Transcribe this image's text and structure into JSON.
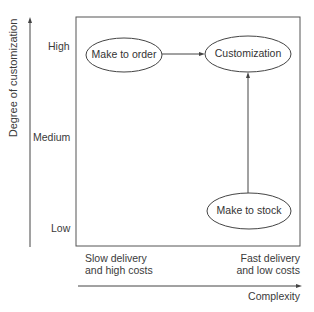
{
  "diagram": {
    "y_axis": {
      "title": "Degree of customization",
      "ticks": [
        "High",
        "Medium",
        "Low"
      ]
    },
    "x_axis": {
      "title": "Complexity",
      "left_label": [
        "Slow delivery",
        "and high costs"
      ],
      "right_label": [
        "Fast delivery",
        "and low costs"
      ]
    },
    "nodes": [
      {
        "id": "make_to_order",
        "label": "Make to order"
      },
      {
        "id": "customization",
        "label": "Customization"
      },
      {
        "id": "make_to_stock",
        "label": "Make to stock"
      }
    ],
    "edges": [
      {
        "from": "make_to_order",
        "to": "customization"
      },
      {
        "from": "make_to_stock",
        "to": "customization"
      }
    ]
  }
}
